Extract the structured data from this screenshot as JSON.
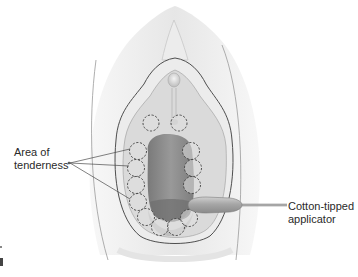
{
  "figure": {
    "type": "anatomical-illustration",
    "colors": {
      "background": "#ffffff",
      "outer_fold": "#e6e6e6",
      "inner_area": "#d9d9d9",
      "opening": "#8f8f8f",
      "opening_shadow": "#6e6e6e",
      "applicator_tip": "#a9a9a9",
      "outline": "#555555",
      "dashed_circle": "#444444"
    }
  },
  "labels": {
    "tenderness": {
      "line1": "Area of",
      "line2": "tenderness"
    },
    "applicator": {
      "line1": "Cotton-tipped",
      "line2": "applicator"
    }
  },
  "tenderness_points": [
    {
      "cx": 150,
      "cy": 123
    },
    {
      "cx": 179,
      "cy": 123
    },
    {
      "cx": 138,
      "cy": 150
    },
    {
      "cx": 137,
      "cy": 167
    },
    {
      "cx": 136,
      "cy": 184
    },
    {
      "cx": 138,
      "cy": 201
    },
    {
      "cx": 145,
      "cy": 216
    },
    {
      "cx": 158,
      "cy": 226
    },
    {
      "cx": 174,
      "cy": 226
    },
    {
      "cx": 186,
      "cy": 216
    },
    {
      "cx": 190,
      "cy": 150
    },
    {
      "cx": 191,
      "cy": 167
    },
    {
      "cx": 190,
      "cy": 184
    }
  ]
}
